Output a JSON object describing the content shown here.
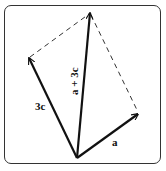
{
  "diagram": {
    "type": "vector-addition-parallelogram",
    "colors": {
      "stroke": "#111111",
      "frame": "#333333",
      "background": "#ffffff"
    },
    "origin": {
      "x": 77,
      "y": 158
    },
    "vectors": [
      {
        "id": "a",
        "label": "a",
        "tip": {
          "x": 138,
          "y": 114
        },
        "style": "solid"
      },
      {
        "id": "3c",
        "label": "3c",
        "tip": {
          "x": 29,
          "y": 58
        },
        "style": "solid"
      },
      {
        "id": "sum",
        "label": "a + 3c",
        "tip": {
          "x": 90,
          "y": 13
        },
        "style": "solid"
      }
    ],
    "dashed_edges": [
      {
        "from": {
          "x": 29,
          "y": 58
        },
        "to": {
          "x": 90,
          "y": 13
        }
      },
      {
        "from": {
          "x": 90,
          "y": 13
        },
        "to": {
          "x": 138,
          "y": 114
        }
      }
    ],
    "labels": {
      "a": "a",
      "three_c": "3c",
      "sum": "a + 3c"
    }
  }
}
